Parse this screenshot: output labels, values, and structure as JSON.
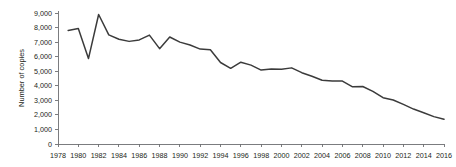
{
  "chart_data": {
    "type": "line",
    "title": "",
    "xlabel": "",
    "ylabel": "Number of copies",
    "ylim": [
      0,
      9000
    ],
    "xlim": [
      1978,
      2016
    ],
    "y_ticks": [
      0,
      1000,
      2000,
      3000,
      4000,
      5000,
      6000,
      7000,
      8000,
      9000
    ],
    "y_tick_labels": [
      "0",
      "1,000",
      "2,000",
      "3,000",
      "4,000",
      "5,000",
      "6,000",
      "7,000",
      "8,000",
      "9,000"
    ],
    "x_ticks": [
      1978,
      1980,
      1982,
      1984,
      1986,
      1988,
      1990,
      1992,
      1994,
      1996,
      1998,
      2000,
      2002,
      2004,
      2006,
      2008,
      2010,
      2012,
      2014,
      2016
    ],
    "x_tick_labels": [
      "1978",
      "1980",
      "1982",
      "1984",
      "1986",
      "1988",
      "1990",
      "1992",
      "1994",
      "1996",
      "1998",
      "2000",
      "2002",
      "2004",
      "2006",
      "2008",
      "2010",
      "2012",
      "2014",
      "2016"
    ],
    "grid": false,
    "legend": false,
    "line_color": "#3b3b3b",
    "axis_color": "#6d6e71",
    "series": [
      {
        "name": "Number of copies",
        "x": [
          1979,
          1980,
          1981,
          1982,
          1983,
          1984,
          1985,
          1986,
          1987,
          1988,
          1989,
          1990,
          1991,
          1992,
          1993,
          1994,
          1995,
          1996,
          1997,
          1998,
          1999,
          2000,
          2001,
          2002,
          2003,
          2004,
          2005,
          2006,
          2007,
          2008,
          2009,
          2010,
          2011,
          2012,
          2013,
          2014,
          2015,
          2016
        ],
        "values": [
          7800,
          7930,
          5870,
          8900,
          7500,
          7200,
          7050,
          7150,
          7480,
          6550,
          7350,
          7000,
          6800,
          6520,
          6480,
          5600,
          5200,
          5620,
          5420,
          5080,
          5150,
          5130,
          5230,
          4900,
          4650,
          4380,
          4330,
          4320,
          3930,
          3950,
          3620,
          3180,
          3020,
          2720,
          2400,
          2150,
          1880,
          1700
        ]
      }
    ]
  }
}
